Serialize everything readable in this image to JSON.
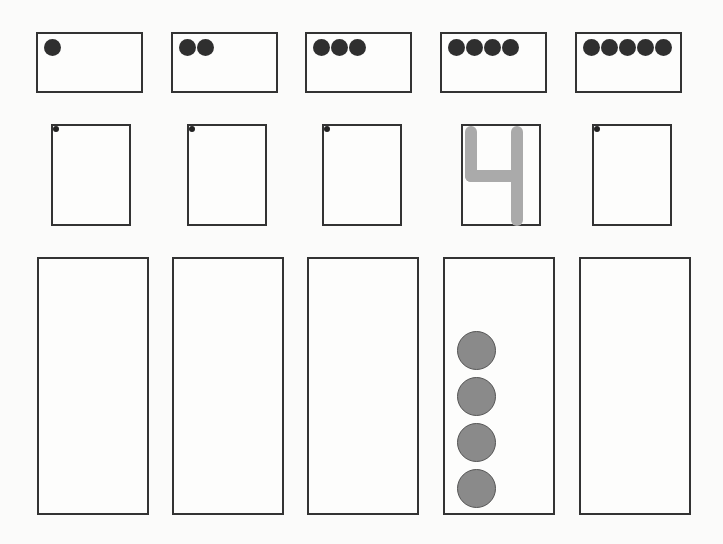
{
  "worksheet": {
    "columns": [
      {
        "id": 1,
        "dot_count": 1,
        "traced_numeral": "",
        "counters": 0
      },
      {
        "id": 2,
        "dot_count": 2,
        "traced_numeral": "",
        "counters": 0
      },
      {
        "id": 3,
        "dot_count": 3,
        "traced_numeral": "",
        "counters": 0
      },
      {
        "id": 4,
        "dot_count": 4,
        "traced_numeral": "4",
        "counters": 4
      },
      {
        "id": 5,
        "dot_count": 5,
        "traced_numeral": "",
        "counters": 0
      }
    ],
    "colors": {
      "border": "#333333",
      "dot": "#2f2f2f",
      "numeral_trace": "#aaaaaa",
      "counter": "#8a8a8a"
    }
  }
}
